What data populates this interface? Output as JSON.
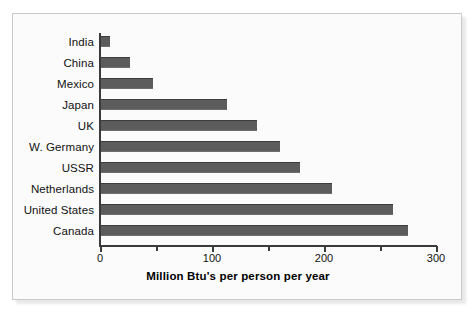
{
  "chart_data": {
    "type": "bar",
    "orientation": "horizontal",
    "title": "",
    "xlabel": "Million Btu's per person per year",
    "ylabel": "",
    "categories": [
      "India",
      "China",
      "Mexico",
      "Japan",
      "UK",
      "W. Germany",
      "USSR",
      "Netherlands",
      "United States",
      "Canada"
    ],
    "values": [
      9,
      27,
      47,
      113,
      140,
      161,
      179,
      207,
      262,
      275
    ],
    "xlim": [
      0,
      300
    ],
    "xticks": [
      0,
      100,
      200,
      300
    ],
    "xtick_labels": [
      "0",
      "100",
      "200",
      "300"
    ],
    "minor_xticks": [
      50,
      150,
      250
    ],
    "grid": false,
    "legend": null,
    "bar_color": "#5c5c5c",
    "axis_color": "#3a3a3a",
    "background_color": "#fbfbfb"
  },
  "figure": {
    "frame_border_color": "#c9c9c9"
  }
}
